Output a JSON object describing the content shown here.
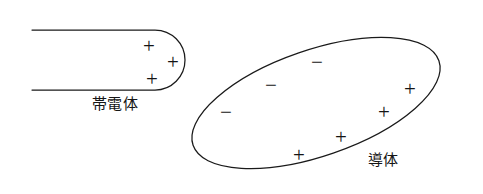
{
  "figure": {
    "title": "",
    "background_color": "#ffffff",
    "stroke_color": "#1a1a1a",
    "width": 483,
    "height": 194
  },
  "charged_body": {
    "label": "帯電体",
    "label_x": 115,
    "label_y": 104,
    "description": "rounded-end bar entering from the left edge",
    "charges": [
      {
        "sign": "+",
        "x": 149,
        "y": 46
      },
      {
        "sign": "+",
        "x": 173,
        "y": 62
      },
      {
        "sign": "+",
        "x": 152,
        "y": 79
      }
    ]
  },
  "conductor": {
    "label": "導体",
    "label_x": 383,
    "label_y": 160,
    "description": "tilted ellipse representing a conductor",
    "charges": [
      {
        "sign": "−",
        "x": 226,
        "y": 112
      },
      {
        "sign": "−",
        "x": 271,
        "y": 85
      },
      {
        "sign": "−",
        "x": 317,
        "y": 62
      },
      {
        "sign": "+",
        "x": 410,
        "y": 89
      },
      {
        "sign": "+",
        "x": 384,
        "y": 112
      },
      {
        "sign": "+",
        "x": 341,
        "y": 137
      },
      {
        "sign": "+",
        "x": 299,
        "y": 155
      }
    ]
  }
}
